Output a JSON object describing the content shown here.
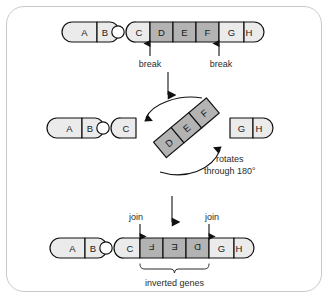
{
  "figure": {
    "colors": {
      "light_segment": "#ebebeb",
      "dark_segment": "#b3b3b3",
      "outline": "#111111",
      "frame_border": "#c9c9c9",
      "background": "#ffffff",
      "text": "#2b2b2b"
    }
  },
  "panel_top": {
    "name": "original-chromosome",
    "segments": [
      {
        "label": "A",
        "shade": "light"
      },
      {
        "label": "B",
        "shade": "light"
      },
      {
        "label": "C",
        "shade": "light"
      },
      {
        "label": "D",
        "shade": "dark"
      },
      {
        "label": "E",
        "shade": "dark"
      },
      {
        "label": "F",
        "shade": "dark"
      },
      {
        "label": "G",
        "shade": "light"
      },
      {
        "label": "H",
        "shade": "light"
      }
    ],
    "annotations": [
      {
        "label": "break",
        "at": "C-D boundary"
      },
      {
        "label": "break",
        "at": "F-G boundary"
      }
    ]
  },
  "panel_middle": {
    "name": "rotating-fragment",
    "left_fragment": [
      {
        "label": "A",
        "shade": "light"
      },
      {
        "label": "B",
        "shade": "light"
      },
      {
        "label": "C",
        "shade": "light"
      }
    ],
    "rotating_fragment": [
      {
        "label": "D",
        "shade": "dark"
      },
      {
        "label": "E",
        "shade": "dark"
      },
      {
        "label": "F",
        "shade": "dark"
      }
    ],
    "right_fragment": [
      {
        "label": "G",
        "shade": "light"
      },
      {
        "label": "H",
        "shade": "light"
      }
    ],
    "rotation_caption_line1": "rotates",
    "rotation_caption_line2": "through 180°"
  },
  "panel_bottom": {
    "name": "inverted-chromosome",
    "segments": [
      {
        "label": "A",
        "shade": "light",
        "inverted": false
      },
      {
        "label": "B",
        "shade": "light",
        "inverted": false
      },
      {
        "label": "C",
        "shade": "light",
        "inverted": false
      },
      {
        "label": "F",
        "shade": "dark",
        "inverted": true
      },
      {
        "label": "E",
        "shade": "dark",
        "inverted": true
      },
      {
        "label": "D",
        "shade": "dark",
        "inverted": true
      },
      {
        "label": "G",
        "shade": "light",
        "inverted": false
      },
      {
        "label": "H",
        "shade": "light",
        "inverted": false
      }
    ],
    "annotations": [
      {
        "label": "join",
        "at": "C-F boundary"
      },
      {
        "label": "join",
        "at": "D-G boundary"
      }
    ],
    "bracket_caption": "inverted genes"
  }
}
